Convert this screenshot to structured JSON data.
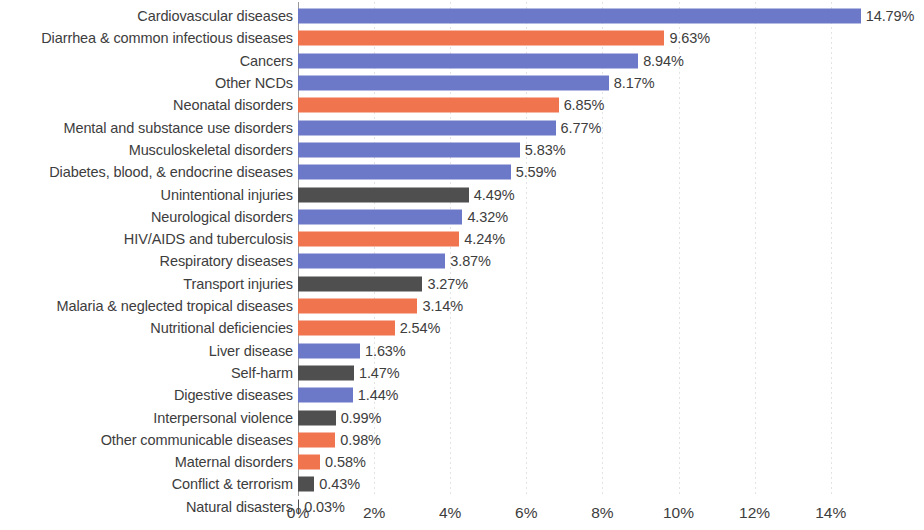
{
  "chart_data": {
    "type": "bar",
    "orientation": "horizontal",
    "title": "",
    "subtitle": "",
    "xlabel": "",
    "ylabel": "",
    "xlim": [
      0,
      15.6
    ],
    "grid": true,
    "legend": null,
    "value_suffix": "%",
    "xticks": [
      {
        "value": 0,
        "label": "0%"
      },
      {
        "value": 2,
        "label": "2%"
      },
      {
        "value": 4,
        "label": "4%"
      },
      {
        "value": 6,
        "label": "6%"
      },
      {
        "value": 8,
        "label": "8%"
      },
      {
        "value": 10,
        "label": "10%"
      },
      {
        "value": 12,
        "label": "12%"
      },
      {
        "value": 14,
        "label": "14%"
      }
    ],
    "colors": {
      "blue": "#6c79c8",
      "orange": "#f0754f",
      "gray": "#4f4f4f"
    },
    "categories": [
      "Cardiovascular diseases",
      "Diarrhea & common infectious diseases",
      "Cancers",
      "Other NCDs",
      "Neonatal disorders",
      "Mental and substance use disorders",
      "Musculoskeletal disorders",
      "Diabetes, blood, & endocrine diseases",
      "Unintentional injuries",
      "Neurological disorders",
      "HIV/AIDS and tuberculosis",
      "Respiratory diseases",
      "Transport injuries",
      "Malaria & neglected tropical diseases",
      "Nutritional deficiencies",
      "Liver disease",
      "Self-harm",
      "Digestive diseases",
      "Interpersonal violence",
      "Other communicable diseases",
      "Maternal disorders",
      "Conflict & terrorism",
      "Natural disasters"
    ],
    "values": [
      14.79,
      9.63,
      8.94,
      8.17,
      6.85,
      6.77,
      5.83,
      5.59,
      4.49,
      4.32,
      4.24,
      3.87,
      3.27,
      3.14,
      2.54,
      1.63,
      1.47,
      1.44,
      0.99,
      0.98,
      0.58,
      0.43,
      0.03
    ],
    "value_labels": [
      "14.79%",
      "9.63%",
      "8.94%",
      "8.17%",
      "6.85%",
      "6.77%",
      "5.83%",
      "5.59%",
      "4.49%",
      "4.32%",
      "4.24%",
      "3.87%",
      "3.27%",
      "3.14%",
      "2.54%",
      "1.63%",
      "1.47%",
      "1.44%",
      "0.99%",
      "0.98%",
      "0.58%",
      "0.43%",
      "0.03%"
    ],
    "bar_colors": [
      "blue",
      "orange",
      "blue",
      "blue",
      "orange",
      "blue",
      "blue",
      "blue",
      "gray",
      "blue",
      "orange",
      "blue",
      "gray",
      "orange",
      "orange",
      "blue",
      "gray",
      "blue",
      "gray",
      "orange",
      "orange",
      "gray",
      "gray"
    ],
    "bars": [
      {
        "category": "Cardiovascular diseases",
        "value": 14.79,
        "label": "14.79%",
        "color": "blue"
      },
      {
        "category": "Diarrhea & common infectious diseases",
        "value": 9.63,
        "label": "9.63%",
        "color": "orange"
      },
      {
        "category": "Cancers",
        "value": 8.94,
        "label": "8.94%",
        "color": "blue"
      },
      {
        "category": "Other NCDs",
        "value": 8.17,
        "label": "8.17%",
        "color": "blue"
      },
      {
        "category": "Neonatal disorders",
        "value": 6.85,
        "label": "6.85%",
        "color": "orange"
      },
      {
        "category": "Mental and substance use disorders",
        "value": 6.77,
        "label": "6.77%",
        "color": "blue"
      },
      {
        "category": "Musculoskeletal disorders",
        "value": 5.83,
        "label": "5.83%",
        "color": "blue"
      },
      {
        "category": "Diabetes, blood, & endocrine diseases",
        "value": 5.59,
        "label": "5.59%",
        "color": "blue"
      },
      {
        "category": "Unintentional injuries",
        "value": 4.49,
        "label": "4.49%",
        "color": "gray"
      },
      {
        "category": "Neurological disorders",
        "value": 4.32,
        "label": "4.32%",
        "color": "blue"
      },
      {
        "category": "HIV/AIDS and tuberculosis",
        "value": 4.24,
        "label": "4.24%",
        "color": "orange"
      },
      {
        "category": "Respiratory diseases",
        "value": 3.87,
        "label": "3.87%",
        "color": "blue"
      },
      {
        "category": "Transport injuries",
        "value": 3.27,
        "label": "3.27%",
        "color": "gray"
      },
      {
        "category": "Malaria & neglected tropical diseases",
        "value": 3.14,
        "label": "3.14%",
        "color": "orange"
      },
      {
        "category": "Nutritional deficiencies",
        "value": 2.54,
        "label": "2.54%",
        "color": "orange"
      },
      {
        "category": "Liver disease",
        "value": 1.63,
        "label": "1.63%",
        "color": "blue"
      },
      {
        "category": "Self-harm",
        "value": 1.47,
        "label": "1.47%",
        "color": "gray"
      },
      {
        "category": "Digestive diseases",
        "value": 1.44,
        "label": "1.44%",
        "color": "blue"
      },
      {
        "category": "Interpersonal violence",
        "value": 0.99,
        "label": "0.99%",
        "color": "gray"
      },
      {
        "category": "Other communicable diseases",
        "value": 0.98,
        "label": "0.98%",
        "color": "orange"
      },
      {
        "category": "Maternal disorders",
        "value": 0.58,
        "label": "0.58%",
        "color": "orange"
      },
      {
        "category": "Conflict & terrorism",
        "value": 0.43,
        "label": "0.43%",
        "color": "gray"
      },
      {
        "category": "Natural disasters",
        "value": 0.03,
        "label": "0.03%",
        "color": "gray"
      }
    ]
  }
}
